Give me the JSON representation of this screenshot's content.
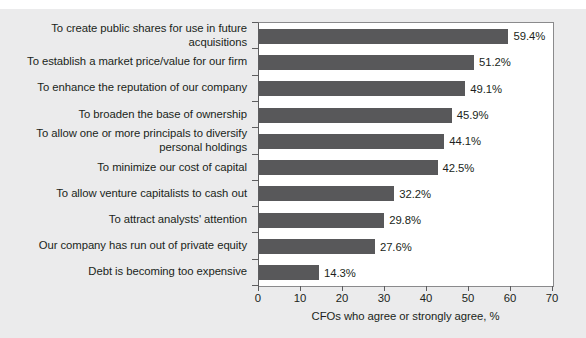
{
  "chart_data": {
    "type": "bar",
    "orientation": "horizontal",
    "title": "",
    "subtitle": "",
    "xlabel": "CFOs who agree or strongly agree, %",
    "ylabel": "",
    "xlim": [
      0,
      70
    ],
    "xticks": [
      0,
      10,
      20,
      30,
      40,
      50,
      60,
      70
    ],
    "xtick_labels": [
      "0",
      "10",
      "20",
      "30",
      "40",
      "50",
      "60",
      "70"
    ],
    "grid": false,
    "legend": null,
    "bar_color": "#58585a",
    "plot_background": "#ffffff",
    "figure_background": "#ebebec",
    "text_color": "#201f20",
    "value_suffix": "%",
    "categories": [
      "To create public shares for use in future\nacquisitions",
      "To establish a market price/value for our firm",
      "To enhance the reputation of our company",
      "To broaden the base of ownership",
      "To allow one or more principals to diversify\npersonal holdings",
      "To minimize our cost of capital",
      "To allow venture capitalists to cash out",
      "To attract analysts' attention",
      "Our company has run out of private equity",
      "Debt is becoming too expensive"
    ],
    "values": [
      59.4,
      51.2,
      49.1,
      45.9,
      44.1,
      42.5,
      32.2,
      29.8,
      27.6,
      14.3
    ],
    "value_labels": [
      "59.4%",
      "51.2%",
      "49.1%",
      "45.9%",
      "44.1%",
      "42.5%",
      "32.2%",
      "29.8%",
      "27.6%",
      "14.3%"
    ]
  }
}
